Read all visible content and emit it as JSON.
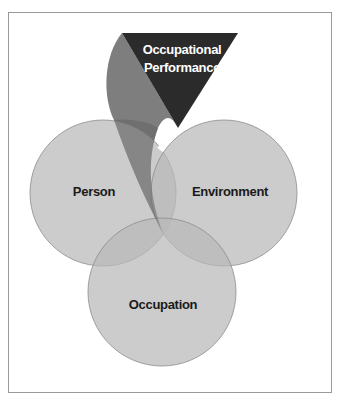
{
  "diagram": {
    "type": "venn-with-emergent-outcome",
    "circles": [
      {
        "id": "person",
        "label": "Person",
        "cx": 103,
        "cy": 193,
        "r": 73
      },
      {
        "id": "environment",
        "label": "Environment",
        "cx": 224,
        "cy": 193,
        "r": 73
      },
      {
        "id": "occupation",
        "label": "Occupation",
        "cx": 162,
        "cy": 292,
        "r": 74
      }
    ],
    "outcome": {
      "id": "occupational-performance",
      "label_line1": "Occupational",
      "label_line2": "Performance"
    },
    "colors": {
      "frame": "#9a9a9a",
      "circle_fill": "#c4c4c4",
      "circle_stroke": "#8c8c8c",
      "ribbon": "#7e7e7e",
      "triangle": "#2b2b2b",
      "text_dark": "#1a1a1a",
      "text_light": "#ffffff"
    }
  }
}
